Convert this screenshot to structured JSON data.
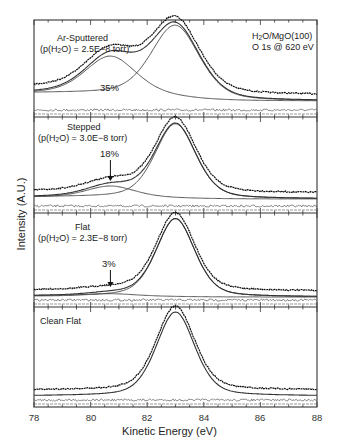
{
  "chart_data": {
    "type": "line",
    "title": "",
    "xlabel": "Kinetic Energy (eV)",
    "ylabel": "Intensity (A.U.)",
    "xlim": [
      78,
      88
    ],
    "x_ticks": [
      78,
      80,
      82,
      84,
      86,
      88
    ],
    "grid": false,
    "annotation": {
      "line1": "H2O/MgO(100)",
      "line2": "O 1s @ 620 eV"
    },
    "panels": [
      {
        "name": "Ar-Sputtered",
        "condition": "(p(H2O) = 2.5E−8 torr)",
        "shoulder_percent": "35%",
        "components": [
          {
            "name": "main peak",
            "center_eV": 83.0,
            "fwhm_eV": 2.0,
            "rel_height": 1.0
          },
          {
            "name": "shoulder (OH)",
            "center_eV": 80.7,
            "fwhm_eV": 2.1,
            "rel_height": 0.52
          }
        ],
        "background": "sloped"
      },
      {
        "name": "Stepped",
        "condition": "(p(H2O) = 3.0E−8 torr)",
        "shoulder_percent": "18%",
        "arrow_at_eV": 80.7,
        "components": [
          {
            "name": "main peak",
            "center_eV": 83.0,
            "fwhm_eV": 1.7,
            "rel_height": 1.0
          },
          {
            "name": "shoulder (OH)",
            "center_eV": 80.7,
            "fwhm_eV": 2.0,
            "rel_height": 0.15
          }
        ]
      },
      {
        "name": "Flat",
        "condition": "(p(H2O) = 2.3E−8 torr)",
        "shoulder_percent": "3%",
        "arrow_at_eV": 80.7,
        "components": [
          {
            "name": "main peak",
            "center_eV": 83.0,
            "fwhm_eV": 1.6,
            "rel_height": 1.0
          },
          {
            "name": "shoulder (OH)",
            "center_eV": 80.7,
            "fwhm_eV": 2.0,
            "rel_height": 0.03
          }
        ]
      },
      {
        "name": "Clean Flat",
        "condition": "",
        "components": [
          {
            "name": "main peak",
            "center_eV": 83.0,
            "fwhm_eV": 1.6,
            "rel_height": 1.0
          }
        ]
      }
    ]
  },
  "labels": {
    "xlabel": "Kinetic Energy (eV)",
    "ylabel": "Intensity (A.U.)",
    "annot_l1_a": "H",
    "annot_l1_sub": "2",
    "annot_l1_b": "O/MgO(100)",
    "annot_l2": "O 1s @ 620 eV",
    "p1_name": "Ar-Sputtered",
    "p1_cond_a": "(p(H",
    "p1_cond_sub": "2",
    "p1_cond_b": "O) = 2.5E−8 torr)",
    "p1_pct": "35%",
    "p2_name": "Stepped",
    "p2_cond_a": "(p(H",
    "p2_cond_sub": "2",
    "p2_cond_b": "O) = 3.0E−8 torr)",
    "p2_pct": "18%",
    "p3_name": "Flat",
    "p3_cond_a": "(p(H",
    "p3_cond_sub": "2",
    "p3_cond_b": "O) = 2.3E−8 torr)",
    "p3_pct": "3%",
    "p4_name": "Clean Flat",
    "ticks": [
      "78",
      "80",
      "82",
      "84",
      "86",
      "88"
    ]
  }
}
